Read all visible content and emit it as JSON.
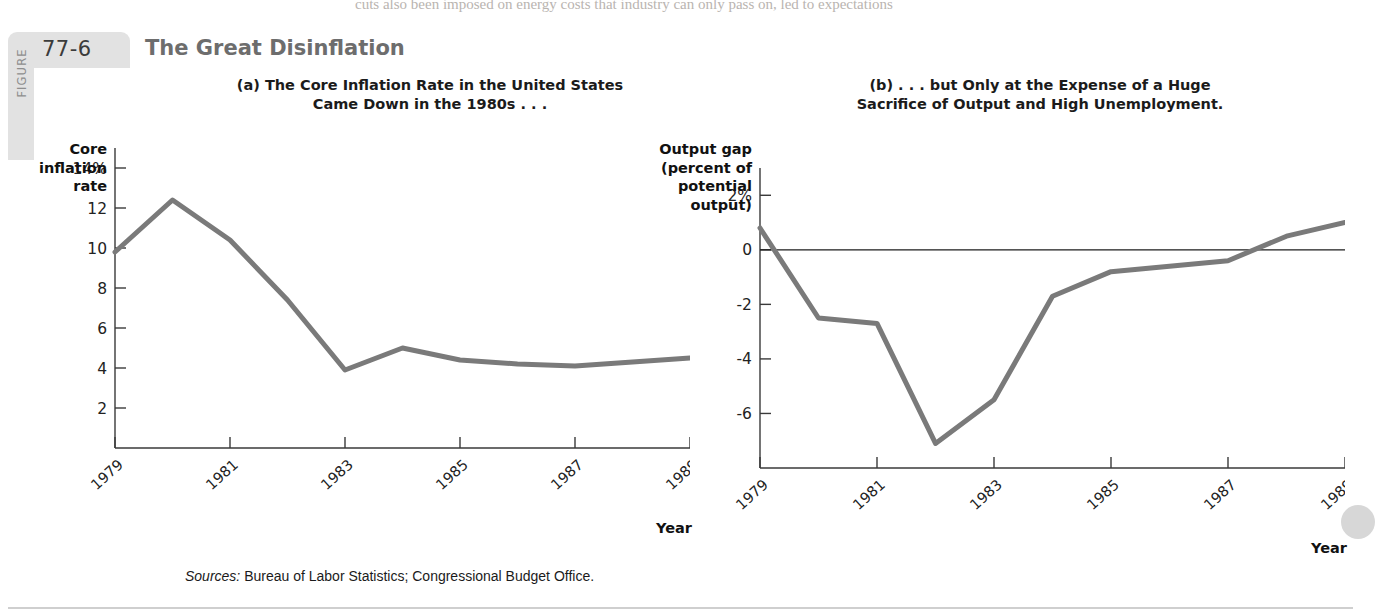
{
  "figure": {
    "label_word": "FIGURE",
    "number": "77-6",
    "title": "The Great Disinflation",
    "sources_prefix": "Sources:",
    "sources_text": " Bureau of Labor Statistics; Congressional Budget Office.",
    "bleed_text": "cuts also been imposed on energy costs that industry can only pass on, led to expectations"
  },
  "chart_data": [
    {
      "type": "line",
      "panel": "a",
      "title_line1": "(a) The Core Inflation Rate in the United States",
      "title_line2": "Came Down in the 1980s . . .",
      "ylabel_lines": [
        "Core",
        "inflation",
        "rate"
      ],
      "xlabel": "Year",
      "x": [
        1979,
        1980,
        1981,
        1982,
        1983,
        1984,
        1985,
        1986,
        1987,
        1988,
        1989
      ],
      "values": [
        9.8,
        12.4,
        10.4,
        7.4,
        3.9,
        5.0,
        4.4,
        4.2,
        4.1,
        4.3,
        4.5
      ],
      "categories": [
        "1979",
        "1980",
        "1981",
        "1982",
        "1983",
        "1984",
        "1985",
        "1986",
        "1987",
        "1988",
        "1989"
      ],
      "ytick_labels": [
        "14%",
        "12",
        "10",
        "8",
        "6",
        "4",
        "2"
      ],
      "ytick_values": [
        14,
        12,
        10,
        8,
        6,
        4,
        2
      ],
      "xtick_labels": [
        "1979",
        "1981",
        "1983",
        "1985",
        "1987",
        "1989"
      ],
      "xtick_values": [
        1979,
        1981,
        1983,
        1985,
        1987,
        1989
      ],
      "ylim": [
        0,
        15
      ],
      "xlim": [
        1979,
        1989
      ],
      "grid": false,
      "legend": "none",
      "line_color": "#7a7a7a",
      "zero_line": false
    },
    {
      "type": "line",
      "panel": "b",
      "title_line1": "(b) . . . but Only at the Expense of a Huge",
      "title_line2": "Sacrifice of Output and High Unemployment.",
      "ylabel_lines": [
        "Output gap",
        "(percent of",
        "potential",
        "output)"
      ],
      "xlabel": "Year",
      "x": [
        1979,
        1980,
        1981,
        1982,
        1983,
        1984,
        1985,
        1986,
        1987,
        1988,
        1989
      ],
      "values": [
        0.8,
        -2.5,
        -2.7,
        -7.1,
        -5.5,
        -1.7,
        -0.8,
        -0.6,
        -0.4,
        0.5,
        1.0
      ],
      "categories": [
        "1979",
        "1980",
        "1981",
        "1982",
        "1983",
        "1984",
        "1985",
        "1986",
        "1987",
        "1988",
        "1989"
      ],
      "ytick_labels": [
        "2%",
        "0",
        "-2",
        "-4",
        "-6",
        "-8"
      ],
      "ytick_values": [
        2,
        0,
        -2,
        -4,
        -6,
        -8
      ],
      "xtick_labels": [
        "1979",
        "1981",
        "1983",
        "1985",
        "1987",
        "1989"
      ],
      "xtick_values": [
        1979,
        1981,
        1983,
        1985,
        1987,
        1989
      ],
      "ylim": [
        -8,
        3
      ],
      "xlim": [
        1979,
        1989
      ],
      "grid": false,
      "legend": "none",
      "line_color": "#7a7a7a",
      "zero_line": true
    }
  ]
}
